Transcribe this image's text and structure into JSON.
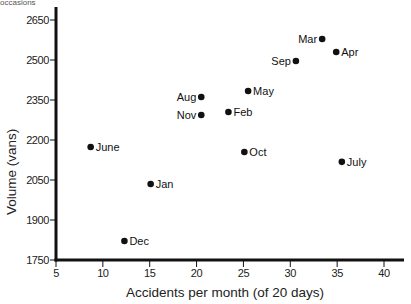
{
  "top_fragment": "occasions",
  "chart_data": {
    "type": "scatter",
    "title": "",
    "xlabel": "Accidents per month (of 20 days)",
    "ylabel": "Volume (vans)",
    "xlim": [
      5,
      42
    ],
    "ylim": [
      1750,
      2700
    ],
    "xticks": [
      5,
      10,
      15,
      20,
      25,
      30,
      35,
      40
    ],
    "yticks": [
      1750,
      1900,
      2050,
      2200,
      2350,
      2500,
      2650
    ],
    "grid": false,
    "legend": null,
    "points": [
      {
        "label": "Jan",
        "x": 15.1,
        "y": 2035,
        "label_side": "right"
      },
      {
        "label": "Feb",
        "x": 23.4,
        "y": 2305,
        "label_side": "right"
      },
      {
        "label": "Mar",
        "x": 33.4,
        "y": 2579,
        "label_side": "left"
      },
      {
        "label": "Apr",
        "x": 34.9,
        "y": 2530,
        "label_side": "right"
      },
      {
        "label": "May",
        "x": 25.5,
        "y": 2384,
        "label_side": "right"
      },
      {
        "label": "June",
        "x": 8.7,
        "y": 2174,
        "label_side": "right"
      },
      {
        "label": "July",
        "x": 35.5,
        "y": 2118,
        "label_side": "right"
      },
      {
        "label": "Aug",
        "x": 20.5,
        "y": 2361,
        "label_side": "left"
      },
      {
        "label": "Sep",
        "x": 30.6,
        "y": 2496,
        "label_side": "left"
      },
      {
        "label": "Oct",
        "x": 25.1,
        "y": 2155,
        "label_side": "right"
      },
      {
        "label": "Nov",
        "x": 20.5,
        "y": 2294,
        "label_side": "left"
      },
      {
        "label": "Dec",
        "x": 12.3,
        "y": 1821,
        "label_side": "right"
      }
    ]
  },
  "colors": {
    "axis": "#111111",
    "point": "#111111",
    "background": "#ffffff"
  }
}
